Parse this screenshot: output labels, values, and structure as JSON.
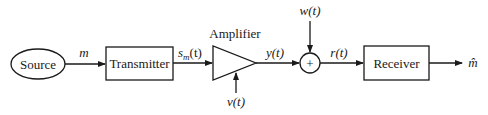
{
  "diagram": {
    "type": "block-diagram",
    "colors": {
      "stroke": "#1a1a1a",
      "background": "#ffffff"
    },
    "blocks": {
      "source": {
        "label": "Source",
        "shape": "ellipse"
      },
      "transmitter": {
        "label": "Transmitter",
        "shape": "rectangle"
      },
      "amplifier": {
        "label": "Amplifier",
        "shape": "triangle"
      },
      "summer": {
        "label": "+",
        "shape": "circle"
      },
      "receiver": {
        "label": "Receiver",
        "shape": "rectangle"
      }
    },
    "signals": {
      "m": "m",
      "sm_base": "s",
      "sm_sub": "m",
      "sm_arg": "(t)",
      "y": "y(t)",
      "v": "v(t)",
      "w": "w(t)",
      "r": "r(t)",
      "m_hat": "m̂"
    },
    "edges": [
      {
        "from": "source",
        "to": "transmitter",
        "label": "m"
      },
      {
        "from": "transmitter",
        "to": "amplifier",
        "label": "s_m(t)"
      },
      {
        "from": "v(t)",
        "to": "amplifier",
        "label": "v(t)"
      },
      {
        "from": "amplifier",
        "to": "summer",
        "label": "y(t)"
      },
      {
        "from": "w(t)",
        "to": "summer",
        "label": "w(t)"
      },
      {
        "from": "summer",
        "to": "receiver",
        "label": "r(t)"
      },
      {
        "from": "receiver",
        "to": "output",
        "label": "m̂"
      }
    ]
  }
}
